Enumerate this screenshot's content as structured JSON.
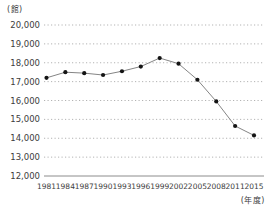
{
  "chart": {
    "y_unit_label": "(館)",
    "x_unit_label": "(年度)"
  },
  "chart_data": {
    "type": "line",
    "title": "",
    "xlabel": "年度",
    "ylabel": "館",
    "categories": [
      "1981",
      "1984",
      "1987",
      "1990",
      "1993",
      "1996",
      "1999",
      "2002",
      "2005",
      "2008",
      "2011",
      "2015"
    ],
    "values": [
      17200,
      17500,
      17450,
      17350,
      17550,
      17800,
      18250,
      17950,
      17100,
      15950,
      14650,
      14150
    ],
    "ylim": [
      12000,
      20000
    ],
    "ytick_interval": 1000,
    "ytick_labels_top_to_bottom": [
      "20,000",
      "19,000",
      "18,000",
      "17,000",
      "16,000",
      "15,000",
      "14,000",
      "13,000",
      "12,000"
    ],
    "grid": "horizontal-dotted",
    "legend": "none",
    "colors": {
      "text": "#3d3d3d",
      "grid": "#b3b3b3",
      "axis": "#8c8c8c",
      "line": "#858585",
      "marker": "#141414",
      "background": "#ffffff"
    }
  }
}
